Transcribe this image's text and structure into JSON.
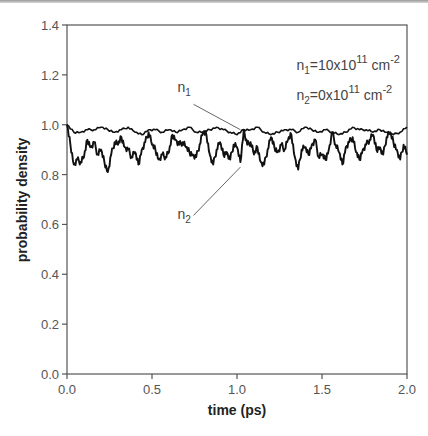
{
  "chart_data": {
    "type": "line",
    "title": "",
    "xlabel": "time (ps)",
    "ylabel": "probability density",
    "xlim": [
      0.0,
      2.0
    ],
    "ylim": [
      0.0,
      1.4
    ],
    "xticks": [
      "0.0",
      "0.5",
      "1.0",
      "1.5",
      "2.0"
    ],
    "yticks": [
      "0.0",
      "0.2",
      "0.4",
      "0.6",
      "0.8",
      "1.0",
      "1.2",
      "1.4"
    ],
    "grid": false,
    "legend": "none",
    "annotations": [
      {
        "text": "n1=10x10^11 cm^-2",
        "x": 1.35,
        "y": 1.22
      },
      {
        "text": "n2=0x10^11 cm^-2",
        "x": 1.35,
        "y": 1.1
      },
      {
        "text": "n1",
        "x": 0.65,
        "y": 1.13,
        "pointer_to": [
          1.02,
          0.98
        ]
      },
      {
        "text": "n2",
        "x": 0.65,
        "y": 0.62,
        "pointer_to": [
          1.02,
          0.83
        ]
      }
    ],
    "series": [
      {
        "name": "n1",
        "x": [
          0.0,
          0.04,
          0.08,
          0.12,
          0.16,
          0.2,
          0.24,
          0.28,
          0.32,
          0.36,
          0.4,
          0.44,
          0.48,
          0.52,
          0.56,
          0.6,
          0.64,
          0.68,
          0.72,
          0.76,
          0.8,
          0.84,
          0.88,
          0.92,
          0.96,
          1.0,
          1.04,
          1.08,
          1.12,
          1.16,
          1.2,
          1.24,
          1.28,
          1.32,
          1.36,
          1.4,
          1.44,
          1.48,
          1.52,
          1.56,
          1.6,
          1.64,
          1.68,
          1.72,
          1.76,
          1.8,
          1.84,
          1.88,
          1.92,
          1.96,
          2.0
        ],
        "values": [
          1.0,
          0.97,
          0.97,
          0.98,
          0.98,
          0.99,
          0.98,
          0.97,
          0.98,
          0.99,
          0.97,
          0.96,
          0.98,
          0.98,
          0.97,
          0.98,
          0.97,
          0.98,
          0.99,
          0.97,
          0.97,
          0.98,
          0.99,
          0.98,
          0.97,
          0.96,
          0.98,
          0.98,
          0.99,
          0.97,
          0.96,
          0.97,
          0.98,
          0.98,
          0.97,
          0.99,
          0.98,
          0.97,
          0.98,
          0.97,
          0.96,
          0.97,
          0.99,
          0.98,
          0.98,
          0.97,
          0.98,
          0.97,
          0.96,
          0.97,
          0.99
        ]
      },
      {
        "name": "n2",
        "x": [
          0.0,
          0.02,
          0.04,
          0.06,
          0.08,
          0.1,
          0.12,
          0.14,
          0.16,
          0.18,
          0.2,
          0.22,
          0.24,
          0.26,
          0.28,
          0.3,
          0.32,
          0.34,
          0.36,
          0.38,
          0.4,
          0.42,
          0.44,
          0.46,
          0.48,
          0.5,
          0.52,
          0.54,
          0.56,
          0.58,
          0.6,
          0.62,
          0.64,
          0.66,
          0.68,
          0.7,
          0.72,
          0.74,
          0.76,
          0.78,
          0.8,
          0.82,
          0.84,
          0.86,
          0.88,
          0.9,
          0.92,
          0.94,
          0.96,
          0.98,
          1.0,
          1.02,
          1.04,
          1.06,
          1.08,
          1.1,
          1.12,
          1.14,
          1.16,
          1.18,
          1.2,
          1.22,
          1.24,
          1.26,
          1.28,
          1.3,
          1.32,
          1.34,
          1.36,
          1.38,
          1.4,
          1.42,
          1.44,
          1.46,
          1.48,
          1.5,
          1.52,
          1.54,
          1.56,
          1.58,
          1.6,
          1.62,
          1.64,
          1.66,
          1.68,
          1.7,
          1.72,
          1.74,
          1.76,
          1.78,
          1.8,
          1.82,
          1.84,
          1.86,
          1.88,
          1.9,
          1.92,
          1.94,
          1.96,
          1.98,
          2.0
        ],
        "values": [
          1.0,
          0.92,
          0.84,
          0.86,
          0.85,
          0.87,
          0.94,
          0.91,
          0.93,
          0.88,
          0.9,
          0.85,
          0.81,
          0.88,
          0.93,
          0.92,
          0.95,
          0.91,
          0.9,
          0.87,
          0.89,
          0.84,
          0.9,
          0.93,
          0.97,
          0.92,
          0.9,
          0.86,
          0.88,
          0.87,
          0.89,
          0.96,
          0.94,
          0.92,
          0.93,
          0.91,
          0.89,
          0.88,
          0.87,
          0.92,
          0.97,
          0.96,
          0.88,
          0.84,
          0.9,
          0.93,
          0.88,
          0.89,
          0.86,
          0.92,
          0.91,
          0.85,
          0.98,
          0.92,
          0.93,
          0.88,
          0.91,
          0.85,
          0.84,
          0.9,
          0.95,
          0.91,
          0.89,
          0.92,
          0.9,
          0.94,
          0.96,
          0.87,
          0.82,
          0.9,
          0.91,
          0.88,
          0.92,
          0.94,
          0.87,
          0.88,
          0.86,
          0.9,
          0.97,
          0.92,
          0.89,
          0.84,
          0.91,
          0.93,
          0.95,
          0.89,
          0.86,
          0.9,
          0.92,
          0.94,
          0.96,
          0.9,
          0.91,
          0.88,
          0.95,
          0.97,
          0.93,
          0.9,
          0.86,
          0.92,
          0.88
        ]
      }
    ]
  }
}
